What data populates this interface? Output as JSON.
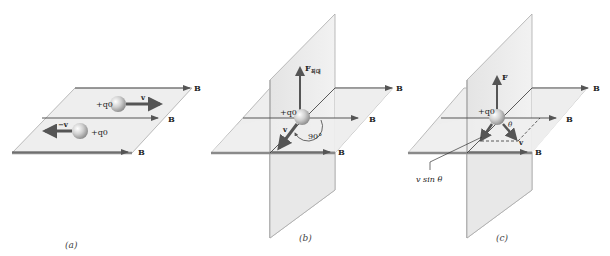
{
  "figure": {
    "colors": {
      "plane_fill": "#eeeeee",
      "plane_edge": "#9a9a9a",
      "plane_front_edge": "#888888",
      "field_line": "#555555",
      "vector": "#555555",
      "charge": "#c8c8c8"
    },
    "panels": [
      {
        "id": "a",
        "caption": "(a)",
        "field_label": "B",
        "charges": [
          {
            "label": "+q0",
            "velocity_label": "v"
          },
          {
            "label": "+q0",
            "velocity_label": "−v"
          }
        ]
      },
      {
        "id": "b",
        "caption": "(b)",
        "field_label": "B",
        "charge_label": "+q0",
        "force_label": "F",
        "force_subscript": "최대",
        "velocity_label": "v",
        "angle_label": "90°"
      },
      {
        "id": "c",
        "caption": "(c)",
        "field_label": "B",
        "charge_label": "+q0",
        "force_label": "F",
        "velocity_label": "v",
        "angle_label": "θ",
        "component_label": "v sin θ"
      }
    ]
  }
}
